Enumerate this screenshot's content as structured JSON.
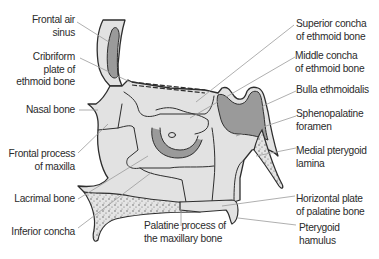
{
  "diagram": {
    "colors": {
      "bone_fill": "#e2e2e2",
      "sinus_fill": "#9a9a9a",
      "outline": "#2e2e2e",
      "leader_line": "#9a9a9a",
      "text": "#2b2b2b"
    },
    "labels_left": [
      {
        "id": "frontal-air-sinus",
        "lines": [
          "Frontal air",
          "sinus"
        ]
      },
      {
        "id": "cribriform-plate",
        "lines": [
          "Cribriform",
          "plate of",
          "ethmoid bone"
        ]
      },
      {
        "id": "nasal-bone",
        "lines": [
          "Nasal bone"
        ]
      },
      {
        "id": "frontal-process-maxilla",
        "lines": [
          "Frontal process",
          "of maxilla"
        ]
      },
      {
        "id": "lacrimal-bone",
        "lines": [
          "Lacrimal bone"
        ]
      },
      {
        "id": "inferior-concha",
        "lines": [
          "Inferior concha"
        ]
      }
    ],
    "labels_right": [
      {
        "id": "superior-concha",
        "lines": [
          "Superior concha",
          "of ethmoid bone"
        ]
      },
      {
        "id": "middle-concha",
        "lines": [
          "Middle concha",
          "of ethmoid bone"
        ]
      },
      {
        "id": "bulla-ethmoidalis",
        "lines": [
          "Bulla ethmoidalis"
        ]
      },
      {
        "id": "sphenopalatine-foramen",
        "lines": [
          "Sphenopalatine",
          "foramen"
        ]
      },
      {
        "id": "medial-pterygoid-lamina",
        "lines": [
          "Medial pterygoid",
          "lamina"
        ]
      },
      {
        "id": "horizontal-plate-palatine",
        "lines": [
          "Horizontal plate",
          "of palatine bone"
        ]
      },
      {
        "id": "pterygoid-hamulus",
        "lines": [
          "Pterygoid",
          "hamulus"
        ]
      }
    ],
    "labels_bottom": [
      {
        "id": "palatine-process-maxilla",
        "lines": [
          "Palatine process of",
          "the maxillary bone"
        ]
      }
    ]
  }
}
